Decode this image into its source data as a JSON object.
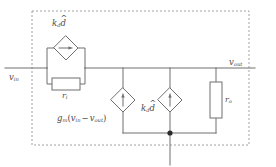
{
  "figure": {
    "kind": "small-signal-equivalent-circuit",
    "dashed_boundary": true
  },
  "nodes": {
    "input": {
      "label_var": "v",
      "label_sub": "in"
    },
    "output": {
      "label_var": "v",
      "label_sub": "out"
    }
  },
  "elements": {
    "dep_source_top": {
      "shape": "diamond",
      "arrow": "right",
      "label_var": "k",
      "label_sub": "d",
      "label_var2": "d",
      "label_hat": "^"
    },
    "resistor_input": {
      "shape": "rect",
      "label_var": "r",
      "label_sub": "i"
    },
    "vccs_gm": {
      "shape": "diamond",
      "arrow": "up",
      "label": "g",
      "label_sub": "m",
      "label_expr_open": "(",
      "label_v1": "v",
      "label_v1_sub": "in",
      "label_minus": "−",
      "label_v2": "v",
      "label_v2_sub": "out",
      "label_expr_close": ")"
    },
    "dep_source_mid": {
      "shape": "diamond",
      "arrow": "up",
      "label_var": "k",
      "label_sub": "d",
      "label_var2": "d",
      "label_hat": "^"
    },
    "resistor_output": {
      "shape": "rect",
      "label_var": "r",
      "label_sub": "o"
    },
    "ground_junction": {
      "shape": "dot"
    }
  },
  "colors": {
    "wire": "#6f6f6f",
    "dashed": "#8a8a8a",
    "text": "#4a4a4a",
    "fill": "#ffffff"
  }
}
